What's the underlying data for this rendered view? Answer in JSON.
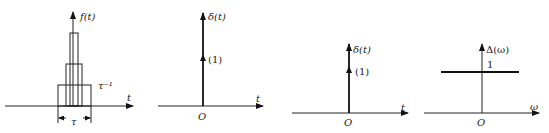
{
  "panels": [
    {
      "id": "rect-pulse-sequence",
      "y_label": "f(t)",
      "x_label": "t",
      "height_label": "τ⁻¹",
      "width_label": "τ",
      "description": "nested rectangular pulses of increasing height and decreasing width"
    },
    {
      "id": "delta-impulse-1",
      "y_label": "δ(t)",
      "x_label": "t",
      "origin_label": "O",
      "impulse_weight": "(1)"
    },
    {
      "id": "delta-impulse-2",
      "y_label": "δ(t)",
      "x_label": "t",
      "origin_label": "O",
      "impulse_weight": "(1)"
    },
    {
      "id": "delta-spectrum",
      "y_label": "Δ(ω)",
      "x_label": "ω",
      "origin_label": "O",
      "level_label": "1"
    }
  ]
}
